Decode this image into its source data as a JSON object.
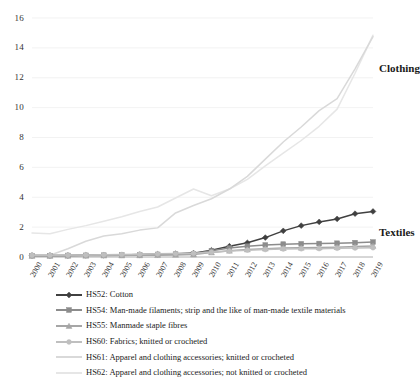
{
  "chart_data": {
    "type": "line",
    "title": "",
    "xlabel": "",
    "ylabel": "",
    "grid": true,
    "legend_position": "bottom",
    "ylim": [
      0,
      16
    ],
    "yticks": [
      0,
      2,
      4,
      6,
      8,
      10,
      12,
      14,
      16
    ],
    "categories": [
      "2000",
      "2001",
      "2002",
      "2003",
      "2004",
      "2005",
      "2006",
      "2007",
      "2008",
      "2009",
      "2010",
      "2011",
      "2012",
      "2013",
      "2014",
      "2015",
      "2016",
      "2017",
      "2018",
      "2019"
    ],
    "annotations": [
      {
        "text": "Clothing",
        "x": 2019,
        "y": 12.6
      },
      {
        "text": "Textiles",
        "x": 2019,
        "y": 1.6
      }
    ],
    "series": [
      {
        "name": "HS52: Cotton",
        "code": "HS52",
        "color": "#404040",
        "marker": "diamond",
        "values": [
          0.1,
          0.1,
          0.1,
          0.11,
          0.12,
          0.14,
          0.16,
          0.18,
          0.22,
          0.26,
          0.45,
          0.72,
          0.95,
          1.3,
          1.75,
          2.1,
          2.35,
          2.55,
          2.9,
          3.05
        ]
      },
      {
        "name": "HS54: Man-made filaments; strip and the like of man-made textile materials",
        "code": "HS54",
        "color": "#8c8c8c",
        "marker": "square",
        "values": [
          0.09,
          0.09,
          0.1,
          0.11,
          0.12,
          0.13,
          0.15,
          0.17,
          0.19,
          0.22,
          0.42,
          0.6,
          0.72,
          0.8,
          0.86,
          0.88,
          0.9,
          0.92,
          0.96,
          1.0
        ]
      },
      {
        "name": "HS55: Manmade staple fibres",
        "code": "HS55",
        "color": "#a6a6a6",
        "marker": "triangle",
        "values": [
          0.07,
          0.07,
          0.08,
          0.08,
          0.09,
          0.1,
          0.11,
          0.12,
          0.14,
          0.16,
          0.3,
          0.42,
          0.5,
          0.56,
          0.6,
          0.62,
          0.64,
          0.66,
          0.7,
          0.74
        ]
      },
      {
        "name": "HS60: Fabrics; knitted or crocheted",
        "code": "HS60",
        "color": "#bfbfbf",
        "marker": "circle",
        "values": [
          0.12,
          0.12,
          0.13,
          0.14,
          0.15,
          0.17,
          0.19,
          0.21,
          0.23,
          0.25,
          0.32,
          0.4,
          0.46,
          0.5,
          0.53,
          0.55,
          0.56,
          0.58,
          0.6,
          0.62
        ]
      },
      {
        "name": "HS61: Apparel and clothing accessories; knitted or crocheted",
        "code": "HS61",
        "color": "#d9d9d9",
        "marker": "none",
        "values": [
          0.1,
          0.12,
          0.55,
          1.05,
          1.4,
          1.55,
          1.8,
          1.95,
          2.95,
          3.45,
          3.9,
          4.55,
          5.4,
          6.55,
          7.7,
          8.7,
          9.8,
          10.6,
          12.6,
          14.75
        ]
      },
      {
        "name": "HS62: Apparel and clothing accessories; not knitted or crocheted",
        "code": "HS62",
        "color": "#e6e6e6",
        "marker": "none",
        "values": [
          1.6,
          1.55,
          1.85,
          2.1,
          2.4,
          2.7,
          3.05,
          3.35,
          3.95,
          4.55,
          4.1,
          4.55,
          5.2,
          6.1,
          6.95,
          7.8,
          8.75,
          9.9,
          12.3,
          14.85
        ]
      }
    ]
  }
}
